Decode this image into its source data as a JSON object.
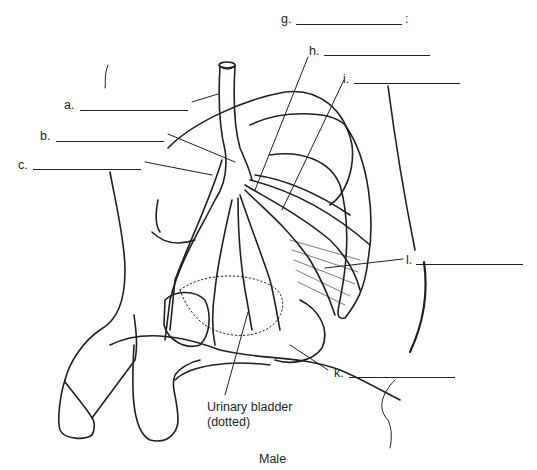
{
  "diagram": {
    "title": "Male",
    "labels": [
      {
        "id": "a",
        "text": "a.",
        "blank": ""
      },
      {
        "id": "b",
        "text": "b.",
        "blank": ""
      },
      {
        "id": "c",
        "text": "c.",
        "blank": ""
      },
      {
        "id": "g",
        "text": "g.",
        "blank": "",
        "suffix": ":"
      },
      {
        "id": "h",
        "text": "h.",
        "blank": ""
      },
      {
        "id": "i",
        "text": "i.",
        "blank": ""
      },
      {
        "id": "l",
        "text": "l.",
        "blank": ""
      },
      {
        "id": "k",
        "text": "k.",
        "blank": ""
      }
    ],
    "annotation": {
      "line1": "Urinary bladder",
      "line2": "(dotted)"
    }
  }
}
